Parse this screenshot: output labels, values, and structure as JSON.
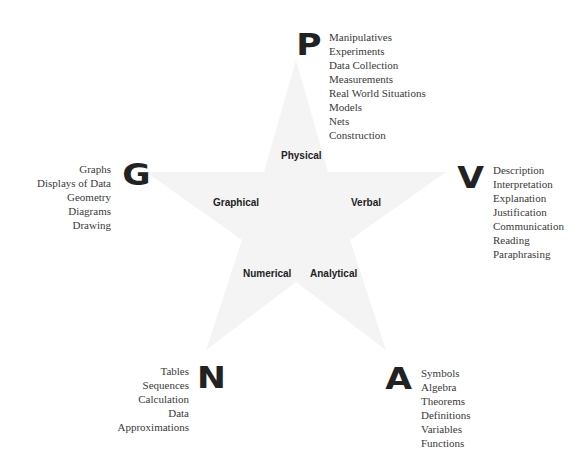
{
  "diagram": {
    "star_color": "#f3f3f3",
    "nodes": [
      {
        "letter": "P",
        "label": "Physical",
        "items": [
          "Manipulatives",
          "Experiments",
          "Data Collection",
          "Measurements",
          "Real World Situations",
          "Models",
          "Nets",
          "Construction"
        ]
      },
      {
        "letter": "V",
        "label": "Verbal",
        "items": [
          "Description",
          "Interpretation",
          "Explanation",
          "Justification",
          "Communication",
          "Reading",
          "Paraphrasing"
        ]
      },
      {
        "letter": "A",
        "label": "Analytical",
        "items": [
          "Symbols",
          "Algebra",
          "Theorems",
          "Definitions",
          "Variables",
          "Functions"
        ]
      },
      {
        "letter": "N",
        "label": "Numerical",
        "items": [
          "Tables",
          "Sequences",
          "Calculation",
          "Data",
          "Approximations"
        ]
      },
      {
        "letter": "G",
        "label": "Graphical",
        "items": [
          "Graphs",
          "Displays of Data",
          "Geometry",
          "Diagrams",
          "Drawing"
        ]
      }
    ]
  }
}
